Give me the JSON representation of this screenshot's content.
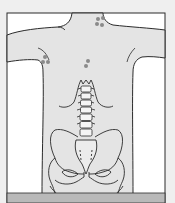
{
  "figure": {
    "colors": {
      "page_bg": "#efefef",
      "frame_bg": "#ffffff",
      "body_fill": "#e4e4e4",
      "outline": "#2b2b2b",
      "marker": "#8a8a8a",
      "bottom_band": "#b9b9b9"
    },
    "marker_groups": [
      {
        "name": "upper-right-trapezius",
        "points": [
          [
            98,
            19
          ],
          [
            103,
            18
          ],
          [
            96,
            24
          ],
          [
            101,
            25
          ]
        ]
      },
      {
        "name": "left-scapula",
        "points": [
          [
            44,
            57
          ],
          [
            42,
            62
          ],
          [
            47,
            63
          ],
          [
            50,
            61
          ]
        ]
      },
      {
        "name": "mid-back",
        "points": [
          [
            88,
            61
          ],
          [
            86,
            66
          ]
        ]
      }
    ]
  }
}
